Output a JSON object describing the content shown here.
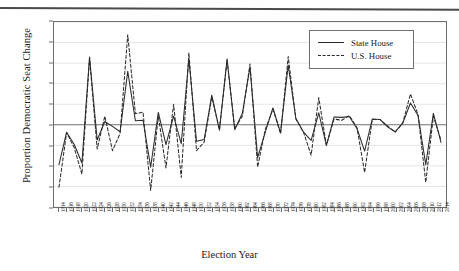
{
  "chart_data": {
    "type": "line",
    "title": "",
    "xlabel": "Election Year",
    "ylabel": "Proportion Democratic Seat Change",
    "ylim": [
      -0.2,
      0.25
    ],
    "yticks": [
      "0.25",
      "0.20",
      "0.15",
      "0.10",
      "0.05",
      "0.00",
      "-0.05",
      "-0.10",
      "-0.15",
      "-0.20"
    ],
    "ytick_values": [
      0.25,
      0.2,
      0.15,
      0.1,
      0.05,
      0.0,
      -0.05,
      -0.1,
      -0.15,
      -0.2
    ],
    "grid": "horizontal",
    "zero_line": true,
    "legend_position": "top-right",
    "categories": [
      "1914",
      "1916",
      "1918",
      "1920",
      "1922",
      "1924",
      "1926",
      "1928",
      "1930",
      "1932",
      "1934",
      "1936",
      "1938",
      "1940",
      "1942",
      "1944",
      "1946",
      "1948",
      "1950",
      "1952",
      "1954",
      "1956",
      "1958",
      "1960",
      "1962",
      "1964",
      "1966",
      "1968",
      "1970",
      "1972",
      "1974",
      "1976",
      "1978",
      "1980",
      "1982",
      "1984",
      "1986",
      "1988",
      "1990",
      "1992",
      "1994",
      "1996",
      "1998",
      "2000",
      "2002",
      "2004",
      "2006",
      "2008",
      "2010",
      "2012",
      "2014"
    ],
    "series": [
      {
        "name": "State House",
        "style": "solid",
        "color": "#2b2b2b",
        "values": [
          -0.097,
          -0.018,
          -0.048,
          -0.093,
          0.165,
          -0.037,
          0.008,
          -0.004,
          -0.017,
          0.13,
          0.01,
          0.011,
          -0.103,
          0.03,
          -0.048,
          0.021,
          -0.046,
          0.16,
          -0.04,
          -0.036,
          0.072,
          -0.013,
          0.16,
          -0.012,
          0.028,
          0.14,
          -0.08,
          -0.018,
          0.041,
          -0.019,
          0.145,
          0.016,
          -0.018,
          -0.038,
          0.029,
          -0.05,
          0.019,
          0.018,
          0.02,
          -0.009,
          -0.064,
          0.014,
          0.013,
          -0.005,
          -0.017,
          0.004,
          0.053,
          0.022,
          -0.097,
          0.028,
          -0.043
        ]
      },
      {
        "name": "U.S. House",
        "style": "dashed",
        "color": "#2b2b2b",
        "values": [
          -0.152,
          -0.019,
          -0.056,
          -0.12,
          0.162,
          -0.059,
          0.021,
          -0.063,
          -0.021,
          0.219,
          0.027,
          0.031,
          -0.16,
          0.022,
          -0.105,
          0.05,
          -0.128,
          0.175,
          -0.063,
          -0.042,
          0.067,
          -0.012,
          0.157,
          -0.009,
          0.021,
          0.148,
          -0.103,
          -0.011,
          0.038,
          -0.022,
          0.166,
          0.014,
          -0.018,
          -0.074,
          0.066,
          -0.05,
          0.014,
          0.011,
          0.022,
          -0.007,
          -0.116,
          0.013,
          0.013,
          -0.003,
          -0.018,
          0.005,
          0.075,
          0.024,
          -0.14,
          0.021,
          -0.038
        ]
      }
    ]
  },
  "legend": {
    "entries": [
      {
        "label": "State House"
      },
      {
        "label": "U.S. House"
      }
    ]
  }
}
